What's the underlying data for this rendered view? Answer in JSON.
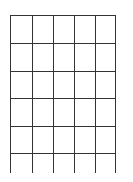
{
  "grid": {
    "stroke_color": "#333333",
    "stroke_width": 1,
    "columns": 5,
    "rows": 6,
    "vertical_lines_x": [
      10,
      32,
      53,
      74,
      95,
      115
    ],
    "horizontal_lines_y": [
      15,
      43,
      71,
      98,
      126,
      153
    ],
    "top": 15,
    "bottom": 173,
    "left": 10,
    "right": 115
  }
}
